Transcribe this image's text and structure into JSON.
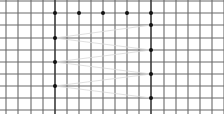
{
  "diagram": {
    "type": "grid-path",
    "width": 224,
    "height": 114,
    "grid": {
      "x_lines": [
        6,
        18,
        31,
        43,
        55,
        67,
        79,
        91,
        103,
        115,
        127,
        139,
        151,
        164,
        176,
        188,
        200,
        212,
        224
      ],
      "y_lines": [
        1,
        13,
        25,
        38,
        50,
        62,
        74,
        86,
        98,
        110
      ],
      "bold_x_lines": [
        55,
        151
      ],
      "line_color": "#6a6a6a",
      "bold_line_color": "#3a3a3a"
    },
    "dots": [
      {
        "x": 55,
        "y": 13
      },
      {
        "x": 79,
        "y": 13
      },
      {
        "x": 103,
        "y": 13
      },
      {
        "x": 127,
        "y": 13
      },
      {
        "x": 151,
        "y": 13
      },
      {
        "x": 151,
        "y": 25
      },
      {
        "x": 55,
        "y": 38
      },
      {
        "x": 151,
        "y": 50
      },
      {
        "x": 55,
        "y": 62
      },
      {
        "x": 151,
        "y": 74
      },
      {
        "x": 55,
        "y": 86
      },
      {
        "x": 151,
        "y": 98
      }
    ],
    "path_order": [
      5,
      6,
      7,
      8,
      9,
      10,
      11
    ],
    "dot_color": "#111111",
    "path_color": "#d8d8d8"
  }
}
